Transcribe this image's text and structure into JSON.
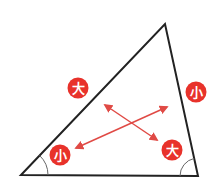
{
  "diagram": {
    "title": "",
    "triangle": {
      "vertices": {
        "bottom_left": [
          21,
          175
        ],
        "top": [
          165,
          24
        ],
        "bottom_right": [
          198,
          176
        ]
      },
      "stroke_color": "#222222"
    },
    "angle_arcs": {
      "bottom_left": {
        "radius": 27
      },
      "bottom_right": {
        "radius": 18
      }
    },
    "labels": [
      {
        "id": "side-left-large",
        "text": "大",
        "cx": 78,
        "cy": 88,
        "meaning": "large side"
      },
      {
        "id": "side-right-small",
        "text": "小",
        "cx": 196,
        "cy": 92,
        "meaning": "small side"
      },
      {
        "id": "angle-left-small",
        "text": "小",
        "cx": 60,
        "cy": 155,
        "meaning": "small angle"
      },
      {
        "id": "angle-right-large",
        "text": "大",
        "cx": 172,
        "cy": 150,
        "meaning": "large angle"
      }
    ],
    "arrows": [
      {
        "from": [
          105,
          105
        ],
        "to": [
          157,
          140
        ],
        "connects": "大 side ↔ 大 angle"
      },
      {
        "from": [
          76,
          148
        ],
        "to": [
          167,
          107
        ],
        "connects": "小 angle ↔ 小 side"
      }
    ],
    "colors": {
      "badge": "#e8322b",
      "arrow": "#e04a45",
      "line": "#222222",
      "arc": "#666666"
    }
  }
}
